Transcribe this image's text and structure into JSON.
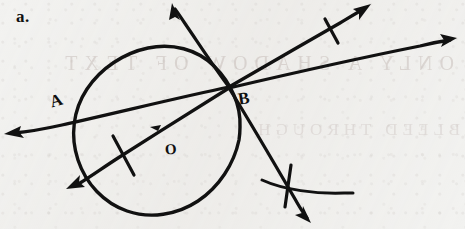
{
  "page": {
    "width": 465,
    "height": 229,
    "background_color": "#f2f2f0",
    "ink_color": "#111111",
    "medium": "hand-drawn pen sketch on paper",
    "ghost_text_front": "ONLY A SHADOW OF TEXT",
    "ghost_text_back": "BLEED THROUGH"
  },
  "labels": {
    "item": "a.",
    "point_a": "A",
    "point_b": "B",
    "center_o": "O"
  },
  "figure": {
    "circle": {
      "center_x": 156,
      "center_y": 131,
      "radius": 84,
      "label": "O"
    },
    "points": [
      {
        "name": "A",
        "x": 58,
        "y": 103,
        "on_circle": true
      },
      {
        "name": "B",
        "x": 228,
        "y": 88,
        "on_circle": true
      },
      {
        "name": "O",
        "x": 171,
        "y": 151,
        "is_center": true
      }
    ],
    "rays": [
      {
        "name": "secant-through-a",
        "from_x": 228,
        "from_y": 88,
        "to_x": 5,
        "to_y": 134,
        "arrowhead": "end",
        "tick_marks": 0
      },
      {
        "name": "ray-upper-left",
        "from_x": 228,
        "from_y": 88,
        "to_x": 173,
        "to_y": 4,
        "arrowhead": "end",
        "tick_marks": 0
      },
      {
        "name": "ray-upper-right-steep",
        "from_x": 228,
        "from_y": 88,
        "to_x": 370,
        "to_y": 5,
        "arrowhead": "end",
        "tick_marks": 1,
        "tick_x": 332,
        "tick_y": 30
      },
      {
        "name": "ray-upper-right-shallow",
        "from_x": 228,
        "from_y": 88,
        "to_x": 456,
        "to_y": 39,
        "arrowhead": "end",
        "tick_marks": 0
      },
      {
        "name": "ray-lower-right",
        "from_x": 228,
        "from_y": 88,
        "to_x": 311,
        "to_y": 222,
        "arrowhead": "end",
        "tick_marks": 1,
        "tick_x": 288,
        "tick_y": 186
      },
      {
        "name": "diameter-to-lower-left",
        "from_x": 228,
        "from_y": 88,
        "to_x": 67,
        "to_y": 188,
        "arrowhead": "end",
        "tick_marks": 1,
        "tick_x": 123,
        "tick_y": 155
      }
    ],
    "construction_arc": {
      "name": "compass-arc-lower-right",
      "from_x": 262,
      "from_y": 180,
      "to_x": 353,
      "to_y": 196,
      "sweep": "shallow arc bulging upward"
    },
    "center_tick": {
      "x": 155,
      "y": 128
    }
  }
}
